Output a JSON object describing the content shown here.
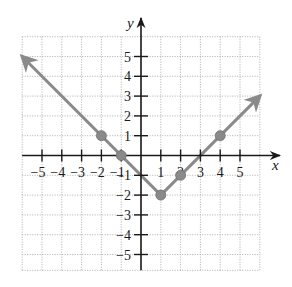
{
  "chart_data": {
    "type": "line",
    "title": "",
    "function": "y = |x - 1| - 2",
    "xlabel": "x",
    "ylabel": "y",
    "xlim": [
      -6,
      6
    ],
    "ylim": [
      -6,
      6
    ],
    "grid": true,
    "grid_style": "dotted",
    "x_ticks": [
      -5,
      -4,
      -3,
      -2,
      -1,
      1,
      2,
      3,
      4,
      5
    ],
    "y_ticks": [
      -5,
      -4,
      -3,
      -2,
      -1,
      1,
      2,
      3,
      4,
      5
    ],
    "x_tick_labels": [
      "−5",
      "−4",
      "−3",
      "−2",
      "−1",
      "1",
      "2",
      "3",
      "4",
      "5"
    ],
    "y_tick_labels": [
      "−5",
      "−4",
      "−3",
      "−2",
      "−1",
      "1",
      "2",
      "3",
      "4",
      "5"
    ],
    "series": [
      {
        "name": "graph",
        "color": "#8a8a8a",
        "x": [
          -6,
          1,
          6
        ],
        "y": [
          5,
          -2,
          3
        ],
        "arrows_at_ends": true
      }
    ],
    "marked_points": [
      {
        "x": -2,
        "y": 1
      },
      {
        "x": -1,
        "y": 0
      },
      {
        "x": 1,
        "y": -2
      },
      {
        "x": 2,
        "y": -1
      },
      {
        "x": 4,
        "y": 1
      }
    ],
    "legend": null
  },
  "labels": {
    "x_axis": "x",
    "y_axis": "y"
  },
  "colors": {
    "axis": "#1a1a1a",
    "grid": "#9a9a9a",
    "graph": "#8a8a8a",
    "point": "#8a8a8a"
  }
}
